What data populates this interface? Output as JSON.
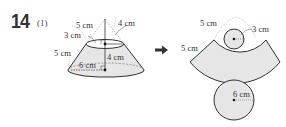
{
  "problem": {
    "number": "14",
    "sub_number": "(1)"
  },
  "frustum": {
    "labels": {
      "slant_upper": "5 cm",
      "top_radius": "3 cm",
      "slant_lower": "5 cm",
      "bottom_radius": "6 cm",
      "height": "4 cm",
      "apex_segment": "4 cm"
    }
  },
  "arrow": {
    "icon": "right-arrow-icon"
  },
  "net": {
    "labels": {
      "inner_slant": "5 cm",
      "outer_slant": "5 cm",
      "small_circle_radius": "3 cm",
      "large_circle_radius": "6 cm"
    }
  },
  "colors": {
    "fill": "#e6e6e6",
    "stroke": "#333333",
    "dashed": "#888888"
  }
}
